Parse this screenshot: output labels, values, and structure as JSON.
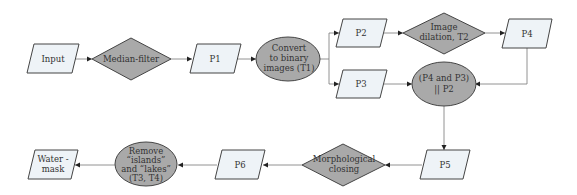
{
  "diagram": {
    "type": "flowchart",
    "nodes": [
      {
        "id": "input",
        "shape": "parallelogram",
        "lines": [
          "Input"
        ]
      },
      {
        "id": "median",
        "shape": "diamond",
        "lines": [
          "Median-filter"
        ]
      },
      {
        "id": "p1",
        "shape": "parallelogram",
        "lines": [
          "P1"
        ]
      },
      {
        "id": "convert",
        "shape": "ellipse",
        "lines": [
          "Convert",
          "to binary",
          "images (T1)"
        ]
      },
      {
        "id": "p2",
        "shape": "parallelogram",
        "lines": [
          "P2"
        ]
      },
      {
        "id": "dilation",
        "shape": "diamond",
        "lines": [
          "Image",
          "dilation, T2"
        ]
      },
      {
        "id": "p4",
        "shape": "parallelogram",
        "lines": [
          "P4"
        ]
      },
      {
        "id": "p3",
        "shape": "parallelogram",
        "lines": [
          "P3"
        ]
      },
      {
        "id": "combine",
        "shape": "ellipse",
        "lines": [
          "(P4 and P3)",
          "|| P2"
        ]
      },
      {
        "id": "p5",
        "shape": "parallelogram",
        "lines": [
          "P5"
        ]
      },
      {
        "id": "closing",
        "shape": "diamond",
        "lines": [
          "Morphological",
          "closing"
        ]
      },
      {
        "id": "p6",
        "shape": "parallelogram",
        "lines": [
          "P6"
        ]
      },
      {
        "id": "remove",
        "shape": "ellipse",
        "lines": [
          "Remove",
          "“islands”",
          "and “lakes”",
          "(T3, T4)"
        ]
      },
      {
        "id": "watermask",
        "shape": "parallelogram",
        "lines": [
          "Water -",
          "mask"
        ]
      }
    ],
    "edges": [
      {
        "from": "input",
        "to": "median"
      },
      {
        "from": "median",
        "to": "p1"
      },
      {
        "from": "p1",
        "to": "convert"
      },
      {
        "from": "convert",
        "to": "p2"
      },
      {
        "from": "convert",
        "to": "p3"
      },
      {
        "from": "p2",
        "to": "dilation"
      },
      {
        "from": "dilation",
        "to": "p4"
      },
      {
        "from": "p4",
        "to": "combine"
      },
      {
        "from": "p3",
        "to": "combine"
      },
      {
        "from": "combine",
        "to": "p5"
      },
      {
        "from": "p5",
        "to": "closing"
      },
      {
        "from": "closing",
        "to": "p6"
      },
      {
        "from": "p6",
        "to": "remove"
      },
      {
        "from": "remove",
        "to": "watermask"
      }
    ]
  },
  "colors": {
    "data_fill": "#eef3f7",
    "process_fill": "#a9a9a9",
    "stroke": "#444444",
    "edge": "#777777"
  }
}
